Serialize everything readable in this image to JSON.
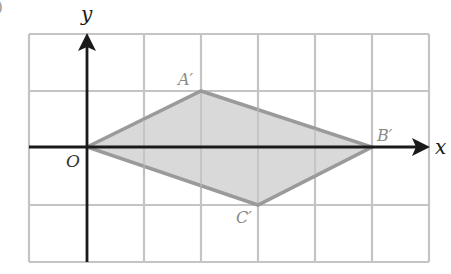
{
  "figure": {
    "corner_mark": ")",
    "axes": {
      "x_label": "x",
      "y_label": "y",
      "origin_label": "O"
    },
    "grid": {
      "x_min": -1,
      "x_max": 6,
      "y_min": -2,
      "y_max": 2,
      "unit_px": 57
    },
    "polygon": {
      "vertices": [
        {
          "label": "O",
          "x": 0,
          "y": 0
        },
        {
          "label": "A′",
          "x": 2,
          "y": 1
        },
        {
          "label": "B′",
          "x": 5,
          "y": 0
        },
        {
          "label": "C′",
          "x": 3,
          "y": -1
        }
      ],
      "fill": "#d2d2d2",
      "stroke": "#9a9a9a"
    },
    "labels": {
      "A": "A′",
      "B": "B′",
      "C": "C′"
    },
    "colors": {
      "grid": "#c4c4c4",
      "axis": "#1a1a1a",
      "vertex_label": "#8a8a8a"
    }
  }
}
